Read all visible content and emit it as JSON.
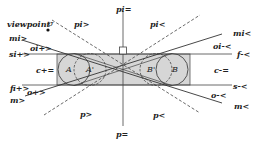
{
  "diagram": {
    "type": "geometric-visibility-diagram",
    "viewpoint_label": "viewpoint",
    "sigma_label": "σ",
    "regions": {
      "A": "A",
      "A_prime": "A'",
      "B_prime": "B'",
      "B": "B"
    },
    "lines": {
      "pi_eq": "pi=",
      "pi_gt": "pi>",
      "pi_lt": "pi<",
      "mi_gt": "mi>",
      "mi_lt": "mi<",
      "oi_gt": "oi+>",
      "oi_lt": "oi-<",
      "si_gt": "si+>",
      "f_lt": "f-<",
      "c_plus_eq": "c+=",
      "c_minus_eq": "c-=",
      "fi_gt": "fi+>",
      "o_gt": "o+>",
      "m_gt": "m>",
      "s_lt": "s-<",
      "o_lt": "o-<",
      "m_lt": "m<",
      "p_gt": "p>",
      "p_lt": "p<",
      "p_eq": "p="
    },
    "colors": {
      "fill": "#d8d8d8",
      "stroke": "#333333",
      "background": "#ffffff"
    }
  }
}
